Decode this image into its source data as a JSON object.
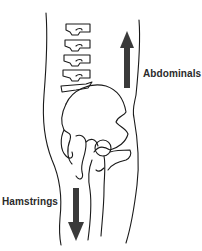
{
  "diagram": {
    "labels": {
      "abdominals": "Abdominals",
      "hamstrings": "Hamstrings"
    },
    "arrows": [
      {
        "name": "abdominals-arrow",
        "direction": "up",
        "color": "#3a3a3a"
      },
      {
        "name": "hamstrings-arrow",
        "direction": "down",
        "color": "#3a3a3a"
      }
    ],
    "colors": {
      "line": "#1a1a1a",
      "arrow": "#3a3a3a",
      "background": "#ffffff"
    }
  }
}
